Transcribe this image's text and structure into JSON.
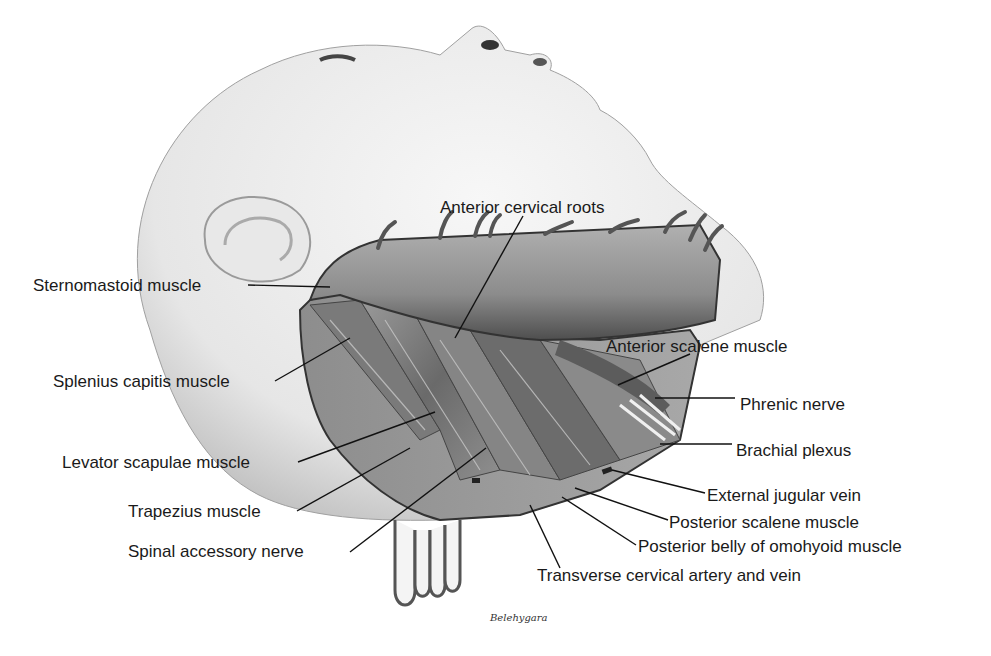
{
  "figure": {
    "signature": "Belehygara",
    "labels": [
      {
        "id": "anterior-cervical-roots",
        "text": "Anterior cervical roots",
        "x": 440,
        "y": 198
      },
      {
        "id": "sternomastoid-muscle",
        "text": "Sternomastoid muscle",
        "x": 33,
        "y": 276
      },
      {
        "id": "splenius-capitis-muscle",
        "text": "Splenius capitis muscle",
        "x": 53,
        "y": 372
      },
      {
        "id": "anterior-scalene-muscle",
        "text": "Anterior scalene muscle",
        "x": 606,
        "y": 337
      },
      {
        "id": "phrenic-nerve",
        "text": "Phrenic nerve",
        "x": 740,
        "y": 395
      },
      {
        "id": "levator-scapulae-muscle",
        "text": "Levator scapulae muscle",
        "x": 62,
        "y": 453
      },
      {
        "id": "brachial-plexus",
        "text": "Brachial plexus",
        "x": 736,
        "y": 441
      },
      {
        "id": "external-jugular-vein",
        "text": "External jugular vein",
        "x": 707,
        "y": 486
      },
      {
        "id": "trapezius-muscle",
        "text": "Trapezius muscle",
        "x": 128,
        "y": 502
      },
      {
        "id": "posterior-scalene-muscle",
        "text": "Posterior scalene muscle",
        "x": 669,
        "y": 513
      },
      {
        "id": "spinal-accessory-nerve",
        "text": "Spinal accessory nerve",
        "x": 128,
        "y": 542
      },
      {
        "id": "posterior-belly-omohyoid",
        "text": "Posterior belly of omohyoid muscle",
        "x": 638,
        "y": 537
      },
      {
        "id": "transverse-cervical-artery-vein",
        "text": "Transverse cervical artery and vein",
        "x": 537,
        "y": 566
      }
    ]
  },
  "colors": {
    "skin": "#ececec",
    "skin_shadow": "#bdbdbd",
    "muscle_dark": "#5a5a5a",
    "muscle_mid": "#8a8a8a",
    "muscle_light": "#b5b5b5",
    "leader_line": "#111111",
    "text": "#1a1a1a"
  }
}
